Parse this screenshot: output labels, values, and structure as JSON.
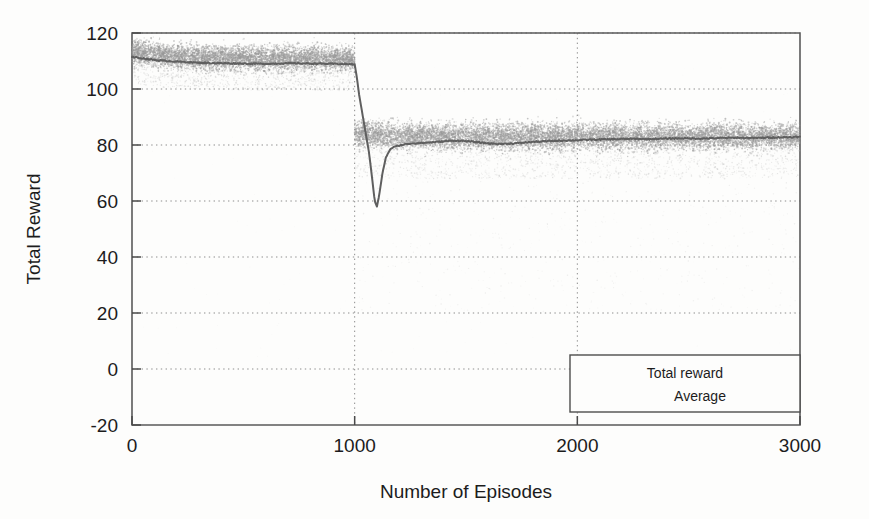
{
  "figure": {
    "background_color": "#fdfdfc",
    "ink_color": "#4a4a4a",
    "scatter_color": "#9a9a9a",
    "average_line_color": "#5f5f5f"
  },
  "axes": {
    "y_title": "Total Reward",
    "x_title": "Number of Episodes",
    "y_ticks": [
      "-20",
      "0",
      "20",
      "40",
      "60",
      "80",
      "100",
      "120"
    ],
    "x_ticks": [
      "0",
      "1000",
      "2000",
      "3000"
    ]
  },
  "legend": {
    "entries": [
      {
        "label": "Total reward"
      },
      {
        "label": "Average"
      }
    ]
  },
  "chart_data": {
    "type": "scatter",
    "title": "",
    "xlabel": "Number of Episodes",
    "ylabel": "Total Reward",
    "xlim": [
      0,
      3000
    ],
    "ylim": [
      -20,
      120
    ],
    "xticks": [
      0,
      1000,
      2000,
      3000
    ],
    "yticks": [
      -20,
      0,
      20,
      40,
      60,
      80,
      100,
      120
    ],
    "grid": true,
    "grid_style": "dotted",
    "legend_position": "lower-right",
    "series": [
      {
        "name": "Total reward",
        "type": "scatter",
        "description": "Dense per-episode reward point cloud. Phase 1 (episodes 0-1000) centred near 110 with spread roughly 100 to 119. Phase 2 (episodes 1000-3000) centred near 82 with spread roughly 71 to 93, plus sparse low outliers during the transition.",
        "phase1": {
          "x_range": [
            0,
            1000
          ],
          "center": 110,
          "spread": [
            100,
            119
          ]
        },
        "phase2": {
          "x_range": [
            1000,
            3000
          ],
          "center": 82,
          "spread": [
            71,
            93
          ]
        }
      },
      {
        "name": "Average",
        "type": "line",
        "description": "Running average of total reward. Stable near 110-111 until episode 1000, then a sharp collapse to a minimum near 58 around episode 1090, followed by recovery and a stable plateau near 80-83 through episode 3000.",
        "x": [
          0,
          60,
          120,
          200,
          300,
          400,
          500,
          600,
          700,
          800,
          900,
          960,
          1000,
          1010,
          1020,
          1035,
          1050,
          1065,
          1080,
          1090,
          1100,
          1110,
          1125,
          1140,
          1160,
          1180,
          1200,
          1230,
          1260,
          1300,
          1350,
          1400,
          1450,
          1500,
          1550,
          1600,
          1650,
          1700,
          1750,
          1800,
          1850,
          1900,
          1950,
          2000,
          2060,
          2120,
          2180,
          2250,
          2320,
          2400,
          2480,
          2560,
          2640,
          2720,
          2800,
          2880,
          2950,
          3000
        ],
        "y": [
          111.5,
          110.8,
          110.2,
          109.8,
          109.4,
          109.2,
          109.1,
          109.0,
          109.2,
          109.1,
          109.0,
          108.9,
          108.8,
          104.0,
          98.0,
          91.0,
          84.0,
          77.0,
          67.0,
          60.0,
          58.0,
          62.0,
          70.0,
          75.5,
          78.5,
          79.5,
          79.8,
          80.3,
          80.6,
          80.7,
          81.0,
          81.3,
          81.6,
          81.4,
          81.0,
          80.6,
          80.4,
          80.5,
          80.8,
          81.1,
          81.3,
          81.5,
          81.6,
          81.7,
          81.9,
          82.0,
          82.1,
          82.2,
          82.1,
          82.3,
          82.4,
          82.3,
          82.5,
          82.6,
          82.5,
          82.7,
          82.8,
          82.9
        ]
      }
    ],
    "annotations": [
      {
        "text": "Sharp reward collapse at episode 1000 (environment change), minimum near 58",
        "x": 1090,
        "y": 58
      }
    ]
  }
}
